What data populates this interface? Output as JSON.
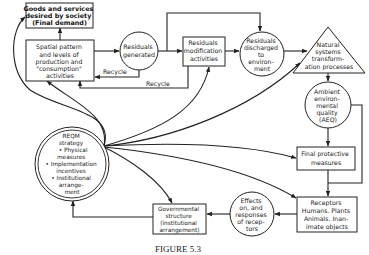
{
  "diagram": {
    "caption": "FIGURE 5.3",
    "nodes": {
      "goods": {
        "shape": "box",
        "lines": [
          "Goods and services",
          "desired by society",
          "(Final demand)"
        ]
      },
      "spatial": {
        "shape": "box",
        "lines": [
          "Spatial pattern",
          "and levels of",
          "production and",
          "\"consumption\"",
          "activities"
        ]
      },
      "generated": {
        "shape": "circle",
        "lines": [
          "Residuals",
          "generated"
        ]
      },
      "modification": {
        "shape": "box",
        "lines": [
          "Residuals",
          "modification",
          "activities"
        ]
      },
      "discharged": {
        "shape": "circle",
        "lines": [
          "Residuals",
          "discharged",
          "to",
          "environ-",
          "ment"
        ]
      },
      "natural": {
        "shape": "triangle",
        "lines": [
          "Natural",
          "systems",
          "transform-",
          "ation processes"
        ]
      },
      "aeq": {
        "shape": "circle",
        "lines": [
          "Ambient",
          "environ-",
          "mental",
          "quality",
          "(AEQ)"
        ]
      },
      "final_protective": {
        "shape": "box",
        "lines": [
          "Final protective",
          "measures"
        ]
      },
      "receptors": {
        "shape": "box",
        "lines": [
          "Receptors",
          "Humans. Plants",
          "Animals. Inan-",
          "imate objects"
        ]
      },
      "effects": {
        "shape": "circle",
        "lines": [
          "Effects",
          "on, and",
          "responses",
          "of recep-",
          "tors"
        ]
      },
      "governmental": {
        "shape": "box",
        "lines": [
          "Governmental",
          "structure",
          "(institutional",
          "arrangement)"
        ]
      },
      "reqm": {
        "shape": "double-circle",
        "lines": [
          "REQM",
          "strategy",
          "• Physical",
          "measures",
          "• Implementation",
          "incentives",
          "• Institutional",
          "arrange-",
          "ment"
        ]
      }
    },
    "edge_labels": {
      "recycle_1": "Recycle",
      "recycle_2": "Recycle"
    },
    "edges": [
      [
        "spatial",
        "goods"
      ],
      [
        "spatial",
        "generated"
      ],
      [
        "generated",
        "modification"
      ],
      [
        "generated",
        "discharged"
      ],
      [
        "generated",
        "spatial",
        "Recycle"
      ],
      [
        "modification",
        "spatial",
        "Recycle"
      ],
      [
        "modification",
        "discharged"
      ],
      [
        "discharged",
        "natural"
      ],
      [
        "natural",
        "aeq"
      ],
      [
        "aeq",
        "final_protective"
      ],
      [
        "aeq",
        "receptors"
      ],
      [
        "final_protective",
        "receptors"
      ],
      [
        "receptors",
        "effects"
      ],
      [
        "effects",
        "governmental"
      ],
      [
        "governmental",
        "reqm"
      ],
      [
        "reqm",
        "goods"
      ],
      [
        "reqm",
        "spatial"
      ],
      [
        "reqm",
        "modification"
      ],
      [
        "reqm",
        "natural"
      ],
      [
        "reqm",
        "final_protective"
      ],
      [
        "reqm",
        "receptors"
      ],
      [
        "reqm",
        "governmental"
      ]
    ]
  }
}
